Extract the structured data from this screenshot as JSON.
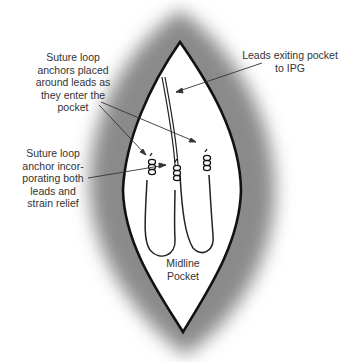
{
  "diagram": {
    "type": "surgical-illustration",
    "colors": {
      "background": "#ffffff",
      "tissue_shadow": "#8a8a8a",
      "pocket_fill": "#ffffff",
      "outline": "#111111",
      "text": "#333333"
    },
    "labels": {
      "suture_loop_anchors": "Suture loop\nanchors placed\naround leads as\nthey enter the\npocket",
      "leads_exiting": "Leads exiting pocket\nto IPG",
      "suture_loop_anchor_both": "Suture loop\nanchor incor-\nporating both\nleads and\nstrain relief",
      "midline_pocket": "Midline\nPocket"
    }
  }
}
